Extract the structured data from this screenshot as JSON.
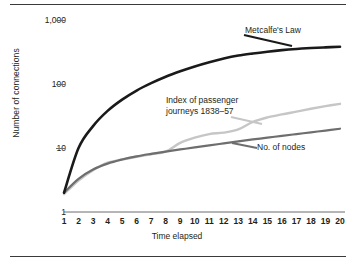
{
  "axes": {
    "ylabel": "Number of connections",
    "xlabel": "Time elapsed",
    "yticks": [
      "1,000",
      "100",
      "10",
      "1"
    ],
    "ytick_values": [
      1000,
      100,
      10,
      1
    ],
    "xticks": [
      "1",
      "2",
      "3",
      "4",
      "5",
      "6",
      "7",
      "8",
      "9",
      "10",
      "11",
      "12",
      "13",
      "14",
      "15",
      "16",
      "17",
      "18",
      "19",
      "20"
    ]
  },
  "labels": {
    "metcalfe": "Metcalfe's Law",
    "passenger": "Index of passenger\njourneys 1838–57",
    "nodes": "No. of nodes"
  },
  "colors": {
    "metcalfe": "#1a1a1a",
    "passenger": "#c6c6c6",
    "nodes": "#6e6e6e",
    "axis": "#6d6d6d",
    "rule": "#3a3a3a",
    "text": "#231f20",
    "background": "#ffffff"
  },
  "chart_data": {
    "type": "line",
    "title": "",
    "xlabel": "Time elapsed",
    "ylabel": "Number of connections",
    "yscale": "log",
    "ylim": [
      1,
      1000
    ],
    "xlim": [
      1,
      20
    ],
    "grid": false,
    "legend": "inline-annotations",
    "x": [
      1,
      2,
      3,
      4,
      5,
      6,
      7,
      8,
      9,
      10,
      11,
      12,
      13,
      14,
      15,
      16,
      17,
      18,
      19,
      20
    ],
    "series": [
      {
        "name": "Metcalfe's Law",
        "color": "#1a1a1a",
        "values": [
          2,
          10,
          22,
          38,
          57,
          79,
          103,
          130,
          158,
          188,
          219,
          250,
          278,
          300,
          320,
          338,
          353,
          365,
          374,
          382
        ]
      },
      {
        "name": "Index of passenger journeys 1838–57",
        "color": "#c6c6c6",
        "values": [
          1.9,
          3.1,
          4.5,
          5.9,
          6.6,
          7.3,
          8.0,
          8.8,
          12.0,
          14.5,
          16.5,
          17.4,
          19.5,
          25.5,
          30.0,
          33.5,
          37.0,
          41.0,
          45.0,
          49.0
        ]
      },
      {
        "name": "No. of nodes",
        "color": "#6e6e6e",
        "values": [
          2.0,
          3.3,
          4.6,
          5.7,
          6.6,
          7.4,
          8.1,
          8.8,
          9.5,
          10.2,
          11.0,
          11.8,
          12.7,
          13.6,
          14.5,
          15.5,
          16.5,
          17.6,
          18.7,
          20.0
        ]
      }
    ]
  }
}
